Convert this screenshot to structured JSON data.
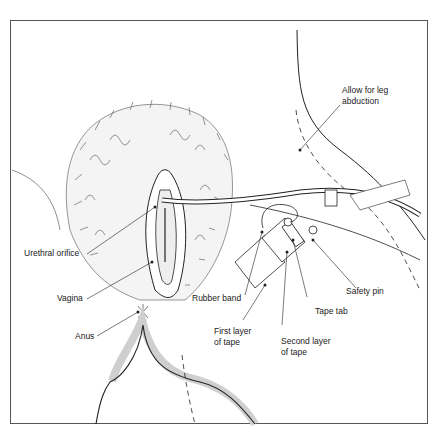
{
  "figure": {
    "labels": {
      "allow_leg_abduction_1": "Allow for leg",
      "allow_leg_abduction_2": "abduction",
      "urethral_orifice": "Urethral orifice",
      "vagina": "Vagina",
      "anus": "Anus",
      "rubber_band": "Rubber band",
      "first_layer_1": "First layer",
      "first_layer_2": "of tape",
      "second_layer_1": "Second layer",
      "second_layer_2": "of tape",
      "tape_tab": "Tape tab",
      "safety_pin": "Safety pin"
    },
    "colors": {
      "line": "#222222",
      "shade": "#cfcfcf",
      "frame": "#555555"
    }
  }
}
